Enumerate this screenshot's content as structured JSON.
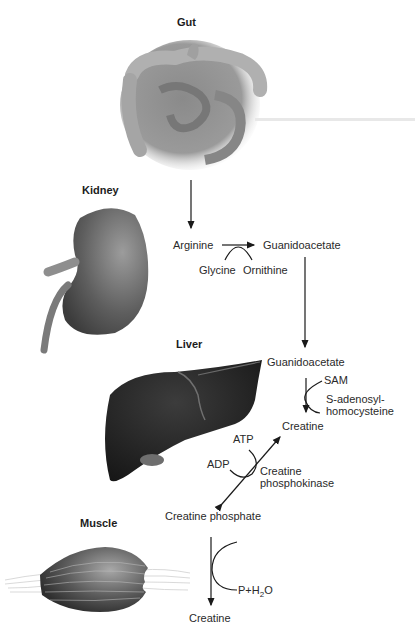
{
  "organs": {
    "gut": "Gut",
    "kidney": "Kidney",
    "liver": "Liver",
    "muscle": "Muscle"
  },
  "pathway": {
    "kidney_step": {
      "substrate": "Arginine",
      "product": "Guanidoacetate",
      "cosubstrate_in": "Glycine",
      "cosubstrate_out": "Ornithine"
    },
    "liver_step": {
      "substrate": "Guanidoacetate",
      "cofactor_in": "SAM",
      "cofactor_out_line1": "S-adenosyl-",
      "cofactor_out_line2": "homocysteine",
      "product": "Creatine"
    },
    "kinase_step": {
      "atp": "ATP",
      "adp": "ADP",
      "enzyme_line1": "Creatine",
      "enzyme_line2": "phosphokinase",
      "product": "Creatine phosphate"
    },
    "muscle_step": {
      "byproduct_prefix": "P+H",
      "byproduct_sub": "2",
      "byproduct_suffix": "O",
      "product": "Creatine"
    }
  }
}
